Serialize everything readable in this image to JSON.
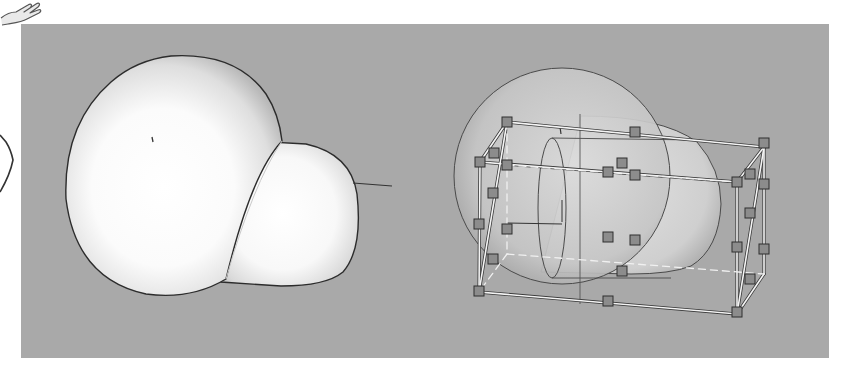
{
  "viewport": {
    "background": "#a9a9a9",
    "page_background": "#ffffff"
  },
  "icons": {
    "cursor": "pointing-hand-icon",
    "side_marker": "bracket-curve-icon"
  },
  "scene": {
    "left_object": {
      "name": "merged-blob",
      "description": "Sphere merged with rounded capsule, solid white shaded"
    },
    "right_object": {
      "name": "selected-blob",
      "description": "Translucent sphere and capsule with selection bounding box and handles"
    },
    "bounding_box": {
      "edge_color": "#f2f2f2",
      "handle_color": "#8a8a8a",
      "handle_count": 26
    }
  }
}
